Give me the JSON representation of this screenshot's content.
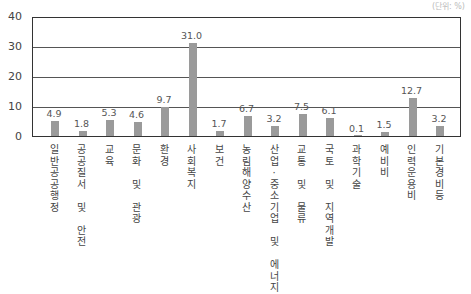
{
  "unit_label": "(단위: %)",
  "chart_data": {
    "type": "bar",
    "title": "",
    "xlabel": "",
    "ylabel": "",
    "ylim": [
      0,
      40
    ],
    "yticks": [
      0,
      10,
      20,
      30,
      40
    ],
    "grid": true,
    "bar_color": "#9a9a9a",
    "categories": [
      "일반공공행정",
      "공공질서 및 안전",
      "교육",
      "문화 및 관광",
      "환경",
      "사회복지",
      "보건",
      "농림해양수산",
      "산업·중소기업 및 에너지",
      "교통 및 물류",
      "국토 및 지역개발",
      "과학기술",
      "예비비",
      "인력운용비",
      "기본경비등"
    ],
    "values": [
      4.9,
      1.8,
      5.3,
      4.6,
      9.7,
      31.0,
      1.7,
      6.7,
      3.2,
      7.5,
      6.1,
      0.1,
      1.5,
      12.7,
      3.2
    ],
    "value_labels": [
      "4.9",
      "1.8",
      "5.3",
      "4.6",
      "9.7",
      "31.0",
      "1.7",
      "6.7",
      "3.2",
      "7.5",
      "6.1",
      "0.1",
      "1.5",
      "12.7",
      "3.2"
    ]
  }
}
